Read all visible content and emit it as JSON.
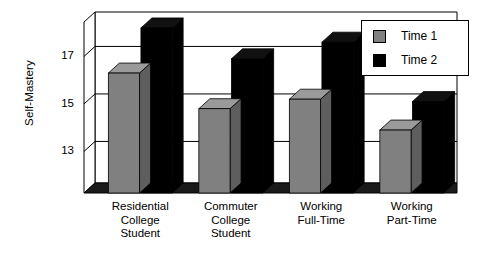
{
  "chart_data": {
    "type": "bar",
    "title": "",
    "subtitle": "",
    "xlabel": "",
    "ylabel": "Self-Mastery",
    "ylim": [
      11.25,
      18.45
    ],
    "yticks": [
      13,
      15,
      17
    ],
    "ytick_labels": [
      "13",
      "15",
      "17"
    ],
    "grid": true,
    "three_d": true,
    "legend_position": "top-right",
    "categories": [
      "Residential\nCollege\nStudent",
      "Commuter\nCollege\nStudent",
      "Working\nFull-Time",
      "Working\nPart-Time"
    ],
    "series": [
      {
        "name": "Time 1",
        "color": "#808080",
        "values": [
          16.3,
          14.8,
          15.2,
          13.9
        ]
      },
      {
        "name": "Time 2",
        "color": "#000000",
        "values": [
          18.2,
          16.9,
          17.6,
          15.1
        ]
      }
    ]
  },
  "legend": {
    "entries": [
      {
        "label": "Time 1",
        "swatch": "#808080"
      },
      {
        "label": "Time 2",
        "swatch": "#000000"
      }
    ]
  },
  "colors": {
    "series_time_1": "#808080",
    "series_time_2": "#000000",
    "axis": "#000000",
    "gridline": "#000000",
    "background": "#ffffff",
    "floor_shadow": "#1a1a1a"
  }
}
